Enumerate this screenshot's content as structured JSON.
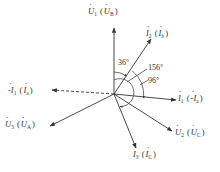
{
  "diagram": {
    "type": "phasor-diagram",
    "origin": [
      114,
      94
    ],
    "vectors": [
      {
        "id": "U1",
        "label": "U",
        "sub": "1",
        "alt_label": "U",
        "alt_sub": "B",
        "end": [
          114,
          28
        ],
        "style": "solid",
        "label_pos": [
          88,
          7
        ]
      },
      {
        "id": "I2",
        "label": "I",
        "sub": "2",
        "alt_label": "I",
        "alt_sub": "b",
        "end": [
          151,
          39
        ],
        "style": "solid",
        "label_pos": [
          146,
          29
        ]
      },
      {
        "id": "I1",
        "label": "I",
        "sub": "1",
        "alt_label": "-I",
        "alt_sub": "a",
        "end": [
          176,
          100
        ],
        "style": "solid",
        "label_pos": [
          178,
          94
        ]
      },
      {
        "id": "U2",
        "label": "U",
        "sub": "2",
        "alt_label": "U",
        "alt_sub": "C",
        "end": [
          172,
          131
        ],
        "style": "solid",
        "label_pos": [
          175,
          128
        ]
      },
      {
        "id": "I3",
        "label": "I",
        "sub": "3",
        "alt_label": "I",
        "alt_sub": "C",
        "end": [
          136,
          148
        ],
        "style": "solid",
        "label_pos": [
          133,
          150
        ]
      },
      {
        "id": "U3",
        "label": "U",
        "sub": "3",
        "alt_label": "U",
        "alt_sub": "A",
        "end": [
          50,
          126
        ],
        "style": "solid",
        "label_pos": [
          5,
          120
        ]
      },
      {
        "id": "negI1",
        "label": "-I",
        "sub": "1",
        "alt_label": "I",
        "alt_sub": "a",
        "end": [
          52,
          90
        ],
        "style": "dashed",
        "label_pos": [
          8,
          86
        ]
      }
    ],
    "angles": [
      {
        "label": "36°",
        "pos": [
          118,
          59
        ]
      },
      {
        "label": "156°",
        "pos": [
          148,
          64
        ]
      },
      {
        "label": "96°",
        "pos": [
          148,
          77
        ]
      }
    ],
    "line_color": "#333333"
  }
}
